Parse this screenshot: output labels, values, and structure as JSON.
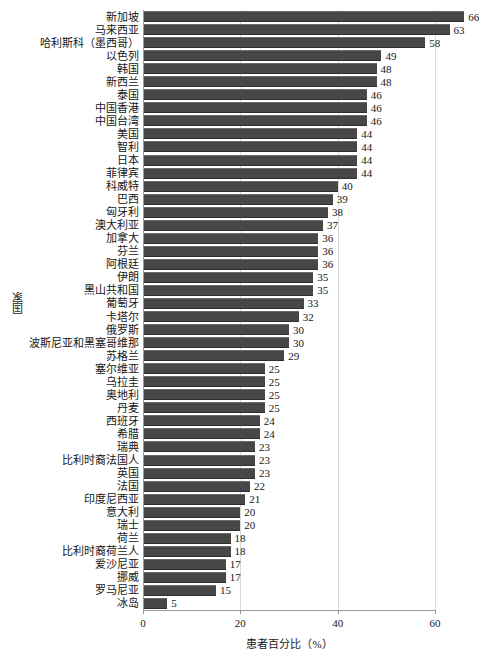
{
  "chart_data": {
    "type": "bar",
    "orientation": "horizontal",
    "title": "",
    "xlabel": "患者百分比（%）",
    "ylabel": "国家",
    "xlim": [
      0,
      60
    ],
    "xticks": [
      0,
      20,
      40,
      60
    ],
    "xtick_labels": [
      "0",
      "20",
      "40",
      "60"
    ],
    "grid": "vertical",
    "legend": "none",
    "bar_color": "#474747",
    "categories": [
      "新加坡",
      "马来西亚",
      "哈利斯科（墨西哥）",
      "以色列",
      "韩国",
      "新西兰",
      "泰国",
      "中国香港",
      "中国台湾",
      "美国",
      "智利",
      "日本",
      "菲律宾",
      "科威特",
      "巴西",
      "匈牙利",
      "澳大利亚",
      "加拿大",
      "芬兰",
      "阿根廷",
      "伊朗",
      "黑山共和国",
      "葡萄牙",
      "卡塔尔",
      "俄罗斯",
      "波斯尼亚和黑塞哥维那",
      "苏格兰",
      "塞尔维亚",
      "乌拉圭",
      "奥地利",
      "丹麦",
      "西班牙",
      "希腊",
      "瑞典",
      "比利时裔法国人",
      "英国",
      "法国",
      "印度尼西亚",
      "意大利",
      "瑞士",
      "荷兰",
      "比利时裔荷兰人",
      "爱沙尼亚",
      "挪威",
      "罗马尼亚",
      "冰岛"
    ],
    "values": [
      66,
      63,
      58,
      49,
      48,
      48,
      46,
      46,
      46,
      44,
      44,
      44,
      44,
      40,
      39,
      38,
      37,
      36,
      36,
      36,
      35,
      35,
      33,
      32,
      30,
      30,
      29,
      25,
      25,
      25,
      25,
      24,
      24,
      23,
      23,
      23,
      22,
      21,
      20,
      20,
      18,
      18,
      17,
      17,
      15,
      5
    ]
  }
}
